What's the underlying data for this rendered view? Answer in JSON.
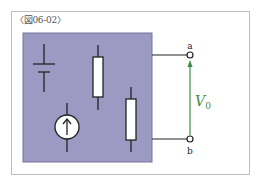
{
  "figure": {
    "label": "〈図06-02〉"
  },
  "circuit": {
    "box_fill": "#9c99c2",
    "box_stroke": "#6f6c93",
    "wire_color": "#222222",
    "arrow_color": "#3d8c45",
    "components": [
      "battery",
      "resistor",
      "current-source",
      "resistor"
    ],
    "terminals": {
      "top": "a",
      "bottom": "b"
    },
    "voltage": {
      "symbol": "V",
      "subscript": "0"
    }
  }
}
